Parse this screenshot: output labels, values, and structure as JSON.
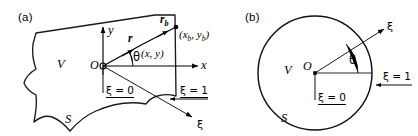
{
  "figure": {
    "caption_a": "(a)",
    "caption_b": "(b)"
  },
  "panel_a": {
    "tag": "(a)",
    "volume_label": "V",
    "surface_label": "S",
    "origin_label": "O",
    "x_axis_label": "x",
    "y_axis_label": "y",
    "angle_label": "θ",
    "vector_r_label": "r",
    "vector_r_sub": "",
    "vector_rb_label": "r",
    "vector_rb_sub": "b",
    "point_interior_label": "(x, y)",
    "point_boundary_prefix": "(x",
    "point_boundary_sub1": "b",
    "point_boundary_mid": ", y",
    "point_boundary_sub2": "b",
    "point_boundary_suffix": ")",
    "xi_zero_label": "ξ = 0",
    "xi_one_label": "ξ = 1",
    "xi_axis_label": "ξ"
  },
  "panel_b": {
    "tag": "(b)",
    "volume_label": "V",
    "surface_label": "S",
    "origin_label": "O",
    "angle_label": "θ",
    "xi_zero_label": "ξ = 0",
    "xi_one_label": "ξ = 1",
    "xi_axis_label": "ξ"
  },
  "colors": {
    "ink": "#000000",
    "outline": "#1a1a1a",
    "background": "#ffffff"
  }
}
